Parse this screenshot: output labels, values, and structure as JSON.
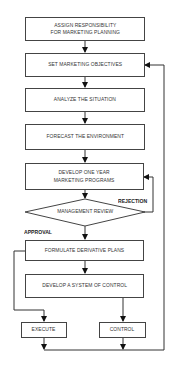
{
  "diagram": {
    "type": "flowchart",
    "colors": {
      "line": "#333333",
      "box_border": "#444444",
      "text": "#333333",
      "background": "#ffffff"
    },
    "steps": [
      {
        "id": "assign",
        "label_lines": [
          "ASSIGN RESPONSIBILITY",
          "FOR MARKETING PLANNING"
        ]
      },
      {
        "id": "objectives",
        "label_lines": [
          "SET MARKETING OBJECTIVES"
        ]
      },
      {
        "id": "analyze",
        "label_lines": [
          "ANALYZE THE SITUATION"
        ]
      },
      {
        "id": "forecast",
        "label_lines": [
          "FORECAST THE ENVIRONMENT"
        ]
      },
      {
        "id": "develop",
        "label_lines": [
          "DEVELOP ONE YEAR",
          "MARKETING PROGRAMS"
        ]
      },
      {
        "id": "review",
        "label_lines": [
          "MANAGEMENT REVIEW"
        ],
        "shape": "diamond"
      },
      {
        "id": "formulate",
        "label_lines": [
          "FORMULATE DERIVATIVE PLANS"
        ]
      },
      {
        "id": "control_system",
        "label_lines": [
          "DEVELOP A SYSTEM OF CONTROL"
        ]
      },
      {
        "id": "execute",
        "label_lines": [
          "EXECUTE"
        ]
      },
      {
        "id": "control",
        "label_lines": [
          "CONTROL"
        ]
      }
    ],
    "edge_labels": {
      "rejection": "REJECTION",
      "approval": "APPROVAL"
    },
    "edges": [
      [
        "assign",
        "objectives"
      ],
      [
        "objectives",
        "analyze"
      ],
      [
        "analyze",
        "forecast"
      ],
      [
        "forecast",
        "develop"
      ],
      [
        "develop",
        "review"
      ],
      [
        "review",
        "develop",
        "REJECTION"
      ],
      [
        "review",
        "formulate",
        "APPROVAL"
      ],
      [
        "formulate",
        "control_system"
      ],
      [
        "formulate",
        "execute"
      ],
      [
        "control_system",
        "control"
      ],
      [
        "execute",
        "objectives"
      ],
      [
        "control",
        "objectives"
      ]
    ]
  }
}
